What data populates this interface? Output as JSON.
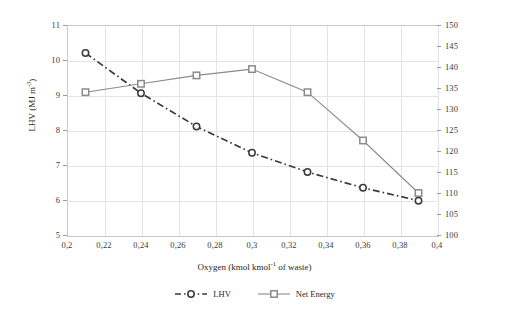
{
  "chart_data": {
    "type": "line",
    "title": "",
    "xlabel": "Oxygen (kmol kmol-1 of waste)",
    "xlabel_parts": {
      "pre": "Oxygen (kmol kmol",
      "sup": "-1",
      "post": " of waste)"
    },
    "ylabel": "LHV (MJ m-3)",
    "ylabel_parts": {
      "pre": "LHV (MJ m",
      "sup": "-3",
      "post": ")"
    },
    "ylabel_right": "Net Energy (MJ kmol-1)",
    "ylabel_right_parts": {
      "pre": "Net Energy (MJ kmol",
      "sup": "-1",
      "post": ")"
    },
    "xlim": [
      0.2,
      0.4
    ],
    "ylim": [
      5,
      11
    ],
    "ylim_right": [
      100,
      150
    ],
    "xticks": [
      "0,2",
      "0,22",
      "0,24",
      "0,26",
      "0,28",
      "0,3",
      "0,32",
      "0,34",
      "0,36",
      "0,38",
      "0,4"
    ],
    "xtick_values": [
      0.2,
      0.22,
      0.24,
      0.26,
      0.28,
      0.3,
      0.32,
      0.34,
      0.36,
      0.38,
      0.4
    ],
    "yticks": [
      "5",
      "6",
      "7",
      "8",
      "9",
      "10",
      "11"
    ],
    "ytick_values": [
      5,
      6,
      7,
      8,
      9,
      10,
      11
    ],
    "yticks_right": [
      "100",
      "105",
      "110",
      "115",
      "120",
      "125",
      "130",
      "135",
      "140",
      "145",
      "150"
    ],
    "ytick_right_values": [
      100,
      105,
      110,
      115,
      120,
      125,
      130,
      135,
      140,
      145,
      150
    ],
    "grid": true,
    "legend_position": "bottom",
    "x": [
      0.21,
      0.24,
      0.27,
      0.3,
      0.33,
      0.36,
      0.39
    ],
    "series": [
      {
        "name": "LHV",
        "axis": "left",
        "marker": "circle",
        "linestyle": "dashdot",
        "color": "#3a3a3a",
        "values": [
          10.2,
          9.05,
          8.1,
          7.35,
          6.8,
          6.35,
          5.98
        ]
      },
      {
        "name": "Net Energy",
        "axis": "right",
        "marker": "square",
        "linestyle": "solid",
        "color": "#8a8a8a",
        "values": [
          134,
          136,
          138,
          139.5,
          134,
          122.5,
          110
        ]
      }
    ]
  },
  "legend": {
    "items": [
      {
        "label": "LHV"
      },
      {
        "label": "Net Energy"
      }
    ]
  },
  "colors": {
    "grid": "#e3e3e8",
    "frame": "#c9c9c9",
    "lhv": "#3a3a3a",
    "net_energy": "#8a8a8a",
    "text": "#262626",
    "background": "#ffffff"
  }
}
